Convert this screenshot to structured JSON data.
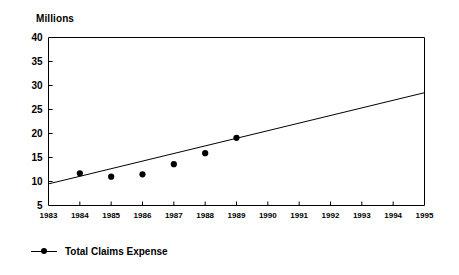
{
  "chart_data": {
    "type": "scatter",
    "title": "",
    "subtitle": "",
    "unit_label": "Millions",
    "xlabel": "",
    "ylabel": "Millions",
    "xlim": [
      1983,
      1995
    ],
    "ylim": [
      5,
      40
    ],
    "ytick_step": 5,
    "grid": false,
    "legend_position": "bottom-left",
    "x_tick_labels": [
      "1983",
      "1984",
      "1985",
      "1986",
      "1987",
      "1988",
      "1989",
      "1990",
      "1991",
      "1992",
      "1993",
      "1994",
      "1995"
    ],
    "y_tick_labels": [
      "5",
      "10",
      "15",
      "20",
      "25",
      "30",
      "35",
      "40"
    ],
    "y_tick_values": [
      5,
      10,
      15,
      20,
      25,
      30,
      35,
      40
    ],
    "series": [
      {
        "name": "Total Claims Expense",
        "marker": "filled-circle",
        "color": "#000000",
        "x": [
          1984,
          1985,
          1986,
          1987,
          1988,
          1989
        ],
        "values": [
          11.7,
          11.0,
          11.5,
          13.6,
          15.9,
          19.1
        ]
      },
      {
        "name": "Trend line",
        "marker": "none",
        "color": "#000000",
        "x": [
          1983,
          1995
        ],
        "values": [
          9.5,
          28.5
        ]
      }
    ],
    "annotations": []
  },
  "legend": {
    "items": [
      {
        "label": "Total Claims Expense",
        "symbol": "line-with-dot",
        "color": "#000000"
      }
    ]
  },
  "colors": {
    "axis": "#000000",
    "marker": "#000000",
    "trend": "#000000",
    "background": "#ffffff"
  }
}
